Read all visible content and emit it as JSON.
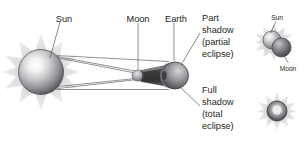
{
  "figure": {
    "background_color": "#ffffff"
  },
  "labels": {
    "sun": "Sun",
    "moon": "Moon",
    "earth": "Earth",
    "part_shadow_line1": "Part",
    "part_shadow_line2": "shadow",
    "part_shadow_line3": "(partial",
    "part_shadow_line4": "eclipse)",
    "full_shadow_line1": "Full",
    "full_shadow_line2": "shadow",
    "full_shadow_line3": "(total",
    "full_shadow_line4": "eclipse)"
  },
  "insets": {
    "partial": {
      "sun_label": "Sun",
      "moon_label": "Moon"
    },
    "total": {
      "caption": ""
    }
  },
  "colors": {
    "body_fill_light": "#d8d8da",
    "body_fill_dark": "#6d6e71",
    "sphere_highlight": "#ffffff",
    "corona": "#d9d9dc",
    "corona_soft": "#e8e8ea",
    "shadow_cone": "#4b4b4d",
    "line": "#58595b",
    "text": "#231f20",
    "background": "#ffffff"
  }
}
